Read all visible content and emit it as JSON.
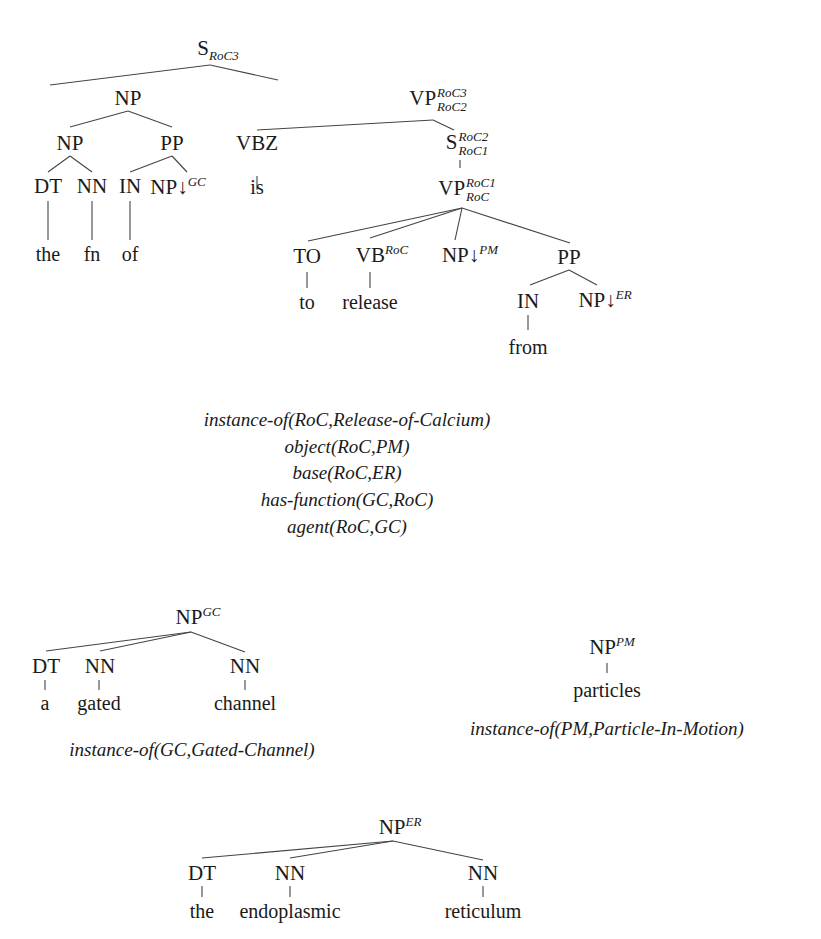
{
  "main_tree": {
    "root": {
      "label": "S",
      "sub": "RoC3"
    },
    "np1": {
      "label": "NP"
    },
    "vp1": {
      "label": "VP",
      "sup": "RoC3",
      "sub": "RoC2"
    },
    "np2": {
      "label": "NP"
    },
    "pp1": {
      "label": "PP"
    },
    "vbz": {
      "label": "VBZ"
    },
    "s2": {
      "label": "S",
      "sup": "RoC2",
      "sub": "RoC1"
    },
    "dt1": {
      "label": "DT"
    },
    "nn1": {
      "label": "NN"
    },
    "in1": {
      "label": "IN"
    },
    "np_gc": {
      "label": "NP",
      "arrow": "↓",
      "sup": "GC"
    },
    "vp2": {
      "label": "VP",
      "sup": "RoC1",
      "sub": "RoC"
    },
    "to": {
      "label": "TO"
    },
    "vb": {
      "label": "VB",
      "sup": "RoC"
    },
    "np_pm": {
      "label": "NP",
      "arrow": "↓",
      "sup": "PM"
    },
    "pp2": {
      "label": "PP"
    },
    "in2": {
      "label": "IN"
    },
    "np_er": {
      "label": "NP",
      "arrow": "↓",
      "sup": "ER"
    },
    "words": {
      "the": "the",
      "fn": "fn",
      "of": "of",
      "is": "is",
      "to": "to",
      "release": "release",
      "from": "from"
    }
  },
  "predicates": [
    "instance-of(RoC,Release-of-Calcium)",
    "object(RoC,PM)",
    "base(RoC,ER)",
    "has-function(GC,RoC)",
    "agent(RoC,GC)"
  ],
  "gc_tree": {
    "root": {
      "label": "NP",
      "sup": "GC"
    },
    "children": [
      {
        "pos": "DT",
        "word": "a"
      },
      {
        "pos": "NN",
        "word": "gated"
      },
      {
        "pos": "NN",
        "word": "channel"
      }
    ],
    "predicate": "instance-of(GC,Gated-Channel)"
  },
  "pm_tree": {
    "root": {
      "label": "NP",
      "sup": "PM"
    },
    "word": "particles",
    "predicate": "instance-of(PM,Particle-In-Motion)"
  },
  "er_tree": {
    "root": {
      "label": "NP",
      "sup": "ER"
    },
    "children": [
      {
        "pos": "DT",
        "word": "the"
      },
      {
        "pos": "NN",
        "word": "endoplasmic"
      },
      {
        "pos": "NN",
        "word": "reticulum"
      }
    ]
  }
}
